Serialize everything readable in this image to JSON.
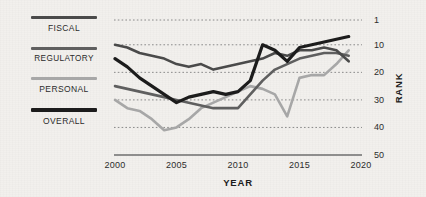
{
  "chart_data": {
    "type": "line",
    "title": "",
    "xlabel": "YEAR",
    "ylabel": "RANK",
    "xlim": [
      2000,
      2020
    ],
    "ylim": [
      1,
      50
    ],
    "y_inverted": true,
    "grid": "horizontal-dotted",
    "legend_position": "left",
    "xticks": [
      "2000",
      "2005",
      "2010",
      "2015",
      "2020"
    ],
    "yticks": [
      "1",
      "10",
      "20",
      "30",
      "40",
      "50"
    ],
    "ytick_values": [
      1,
      10,
      20,
      30,
      40,
      50
    ],
    "xtick_values": [
      2000,
      2005,
      2010,
      2015,
      2020
    ],
    "x": [
      2000,
      2001,
      2002,
      2003,
      2004,
      2005,
      2006,
      2007,
      2008,
      2009,
      2010,
      2011,
      2012,
      2013,
      2014,
      2015,
      2016,
      2017,
      2018,
      2019
    ],
    "series": [
      {
        "name": "FISCAL",
        "color": "#4a4a4a",
        "width": 2.6,
        "values": [
          10,
          11,
          13,
          14,
          15,
          17,
          18,
          17,
          19,
          18,
          17,
          16,
          15,
          13,
          14,
          12,
          12,
          11,
          12,
          16
        ]
      },
      {
        "name": "REGULATORY",
        "color": "#5f5f5f",
        "width": 2.6,
        "values": [
          25,
          26,
          27,
          28,
          29,
          30,
          31,
          32,
          33,
          33,
          33,
          28,
          23,
          19,
          17,
          15,
          14,
          13,
          13,
          14
        ]
      },
      {
        "name": "PERSONAL",
        "color": "#a7a7a7",
        "width": 2.6,
        "values": [
          30,
          33,
          34,
          37,
          41,
          40,
          37,
          33,
          31,
          29,
          27,
          25,
          26,
          28,
          36,
          22,
          21,
          21,
          17,
          12
        ]
      },
      {
        "name": "OVERALL",
        "color": "#1c1c1c",
        "width": 3.2,
        "values": [
          15,
          18,
          22,
          25,
          28,
          31,
          29,
          28,
          27,
          28,
          27,
          23,
          10,
          12,
          16,
          11,
          10,
          9,
          8,
          7
        ]
      }
    ]
  },
  "legend": {
    "items": [
      {
        "label": "FISCAL",
        "color": "#4a4a4a",
        "thickness": "3px"
      },
      {
        "label": "REGULATORY",
        "color": "#5f5f5f",
        "thickness": "3px"
      },
      {
        "label": "PERSONAL",
        "color": "#a7a7a7",
        "thickness": "3px"
      },
      {
        "label": "OVERALL",
        "color": "#1c1c1c",
        "thickness": "3.5px"
      }
    ]
  },
  "axes": {
    "x_title": "YEAR",
    "y_title": "RANK",
    "axis_line_color": "#6e6e6e",
    "gridline_color": "#8a8a8a"
  },
  "colors": {
    "background": "#f2f0ed",
    "text": "#2b2b2b"
  }
}
